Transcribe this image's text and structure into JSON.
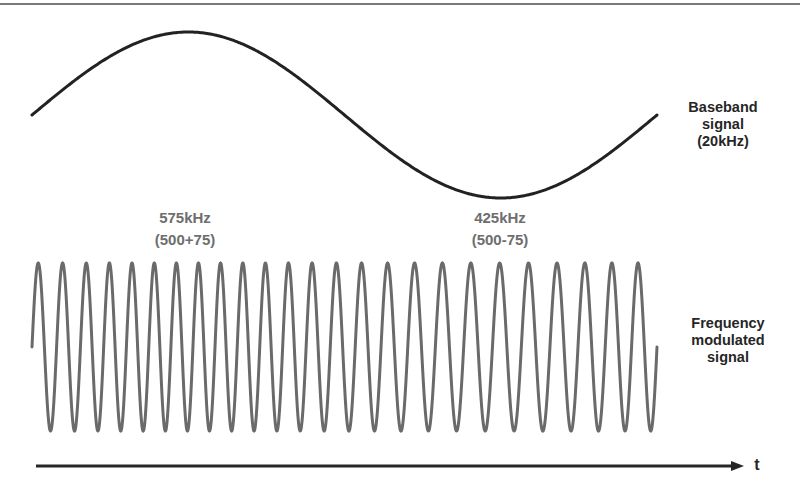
{
  "diagram": {
    "colors": {
      "border_line": "#7a7a7a",
      "baseband_wave": "#222222",
      "fm_wave": "#6a6a6a",
      "axis": "#262626",
      "dark_text": "#262626",
      "gray_text": "#6e6e6e"
    },
    "baseband": {
      "label_lines": [
        "Baseband",
        "signal",
        "(20kHz)"
      ],
      "x_start": 32,
      "x_end": 657,
      "center_y": 115,
      "amplitude": 83,
      "cycles": 1
    },
    "fm": {
      "label_lines": [
        "Frequency",
        "modulated",
        "signal"
      ],
      "x_start": 32,
      "x_end": 657,
      "center_y": 347,
      "amplitude": 84,
      "peak_count": 25
    },
    "annotations": [
      {
        "lines": [
          "575kHz",
          "(500+75)"
        ],
        "center_x": 185
      },
      {
        "lines": [
          "425kHz",
          "(500-75)"
        ],
        "center_x": 500
      }
    ],
    "axis": {
      "label": "t",
      "x_start": 36,
      "x_end": 744,
      "y": 466
    }
  }
}
